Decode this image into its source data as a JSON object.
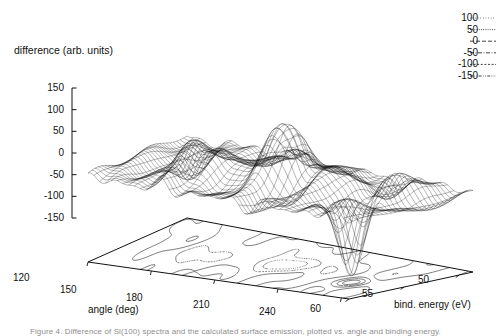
{
  "figure": {
    "type": "3d-surface-with-contour-base",
    "zaxis_title": "difference (arb. units)",
    "xaxis_title": "angle (deg)",
    "yaxis_title": "bind. energy (eV)",
    "caption": "Figure 4. Difference of Si(100) spectra and the calculated surface emission, plotted vs. angle and binding energy."
  },
  "chart_data": {
    "type": "surface",
    "title": "difference (arb. units)",
    "xlabel": "angle (deg)",
    "ylabel": "bind. energy (eV)",
    "zlabel": "difference (arb. units)",
    "grid": false,
    "legend_position": "top-right",
    "xlim": [
      120,
      250
    ],
    "ylim": [
      50,
      61
    ],
    "zlim": [
      -175,
      190
    ],
    "xticks": [
      "120",
      "150",
      "180",
      "210",
      "240"
    ],
    "xtick_values": [
      120,
      150,
      180,
      210,
      240
    ],
    "yticks": [
      "60",
      "55",
      "50"
    ],
    "ytick_values": [
      60,
      55,
      50
    ],
    "zticks": [
      "150",
      "100",
      "50",
      "0",
      "-50",
      "-100",
      "-150"
    ],
    "ztick_values": [
      150,
      100,
      50,
      0,
      -50,
      -100,
      -150
    ],
    "contour_levels": [
      100,
      50,
      0,
      -50,
      -100,
      -150
    ],
    "peak_max": 185,
    "peak_max_at": {
      "angle": 196,
      "energy": 55.5
    },
    "peak_min": -172,
    "peak_min_at": {
      "angle": 238,
      "energy": 53.5
    },
    "mesh_nx": 46,
    "mesh_ny": 30
  },
  "legend": {
    "entries": [
      {
        "value": "100",
        "style": "dotted-fine"
      },
      {
        "value": "50",
        "style": "dotted-dense"
      },
      {
        "value": "0",
        "style": "dash-long"
      },
      {
        "value": "-50",
        "style": "dash-dot"
      },
      {
        "value": "-100",
        "style": "dash-short"
      },
      {
        "value": "-150",
        "style": "dash-dot-dot"
      }
    ]
  }
}
